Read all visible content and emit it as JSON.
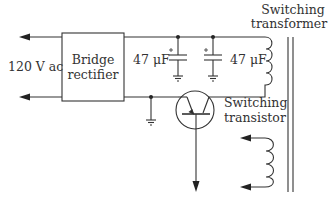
{
  "diagram": {
    "type": "circuit-schematic",
    "labels": {
      "input": "120 V ac",
      "rectifier_line1": "Bridge",
      "rectifier_line2": "rectifier",
      "cap1": "47 μF",
      "cap2": "47 μF",
      "transformer_line1": "Switching",
      "transformer_line2": "transformer",
      "transistor_line1": "Switching",
      "transistor_line2": "transistor"
    },
    "components": [
      {
        "name": "bridge-rectifier",
        "kind": "block"
      },
      {
        "name": "capacitor-1",
        "kind": "electrolytic-capacitor",
        "value": "47 μF"
      },
      {
        "name": "capacitor-2",
        "kind": "electrolytic-capacitor",
        "value": "47 μF"
      },
      {
        "name": "switching-transformer",
        "kind": "transformer"
      },
      {
        "name": "switching-transistor",
        "kind": "npn-transistor"
      }
    ],
    "colors": {
      "line": "#333333",
      "background": "#ffffff"
    }
  }
}
